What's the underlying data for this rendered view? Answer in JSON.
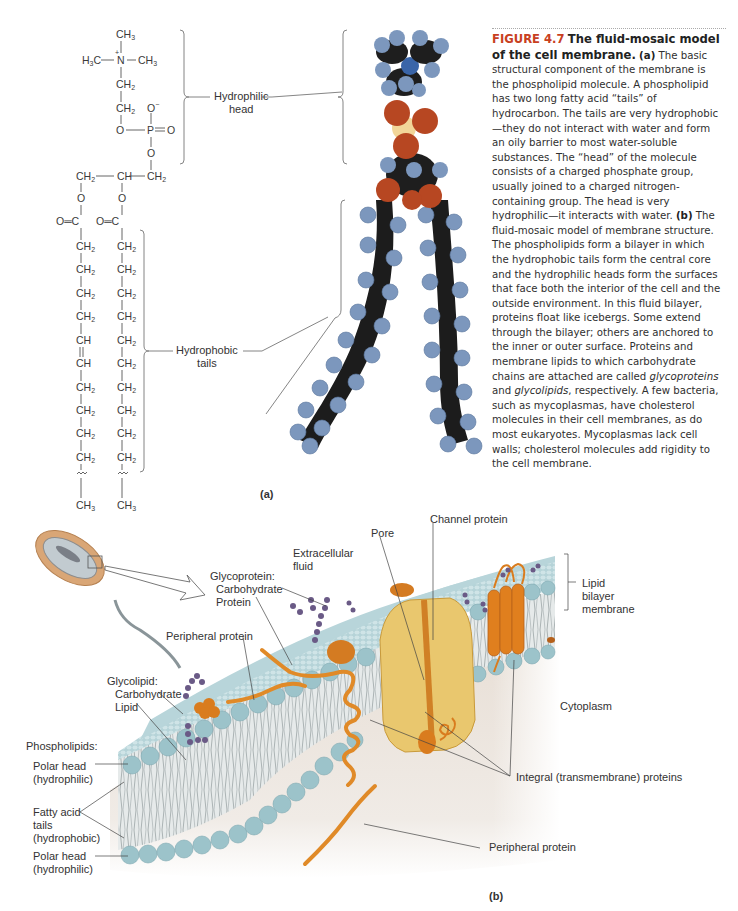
{
  "figure": {
    "number": "FIGURE 4.7",
    "title": "The fluid-mosaic model of the cell membrane.",
    "accent_color": "#c8401f"
  },
  "caption": {
    "part_a_label": "(a)",
    "part_a_text": "The basic structural component of the membrane is the phospholipid molecule. A phospholipid has two long fatty acid “tails” of hydrocarbon. The tails are very hydrophobic—they do not interact with water and form an oily barrier to most water-soluble substances. The “head” of the molecule consists of a charged phosphate group, usually joined to a charged nitrogen-containing group. The head is very hydrophilic—it interacts with water.",
    "part_b_label": "(b)",
    "part_b_text_1": "The fluid-mosaic model of membrane structure. The phospholipids form a bilayer in which the hydrophobic tails form the central core and the hydrophilic heads form the surfaces that face both the interior of the cell and the outside environment. In this fluid bilayer, proteins float like icebergs. Some extend through the bilayer; others are anchored to the inner or outer surface. Proteins and membrane lipids to which carbohydrate chains are attached are called ",
    "term_glycoproteins": "glycoproteins",
    "and": " and ",
    "term_glycolipids": "glycolipids",
    "part_b_text_2": ", respectively. A few bacteria, such as mycoplasmas, have cholesterol molecules in their cell membranes, as do most eukaryotes. Mycoplasmas lack cell walls; cholesterol molecules add rigidity to the cell membrane."
  },
  "panel_a": {
    "label": "(a)",
    "head_label_line1": "Hydrophilic",
    "head_label_line2": "head",
    "tails_label_line1": "Hydrophobic",
    "tails_label_line2": "tails",
    "formula": {
      "ch3_top": "CH3",
      "n_group_left": "H3C",
      "n_atom": "N",
      "n_charge": "+",
      "n_group_right": "CH3",
      "ch2": "CH2",
      "o_minus": "O",
      "o": "O",
      "p": "P",
      "eq_o": "O",
      "glycerol": [
        "CH2",
        "CH",
        "CH2"
      ],
      "carbonyl": "O=C",
      "chain_left": [
        "CH2",
        "CH2",
        "CH2",
        "CH2",
        "CH",
        "CH",
        "CH2",
        "CH2",
        "CH2",
        "CH2"
      ],
      "chain_right": [
        "CH2",
        "CH2",
        "CH2",
        "CH2",
        "CH2",
        "CH2",
        "CH2",
        "CH2",
        "CH2",
        "CH2"
      ],
      "terminal": "CH3"
    }
  },
  "panel_b": {
    "label": "(b)",
    "labels": {
      "extracellular_1": "Extracellular",
      "extracellular_2": "fluid",
      "glycoprotein_1": "Glycoprotein:",
      "glycoprotein_2": "Carbohydrate",
      "glycoprotein_3": "Protein",
      "peripheral_top": "Peripheral protein",
      "glycolipid_1": "Glycolipid:",
      "glycolipid_2": "Carbohydrate",
      "glycolipid_3": "Lipid",
      "pore": "Pore",
      "channel": "Channel protein",
      "lipid_bilayer_1": "Lipid",
      "lipid_bilayer_2": "bilayer",
      "lipid_bilayer_3": "membrane",
      "cytoplasm": "Cytoplasm",
      "phospholipids": "Phospholipids:",
      "polar_head_top_1": "Polar head",
      "polar_head_top_2": "(hydrophilic)",
      "fatty_acid_1": "Fatty acid",
      "fatty_acid_2": "tails",
      "fatty_acid_3": "(hydrophobic)",
      "polar_head_bot_1": "Polar head",
      "polar_head_bot_2": "(hydrophilic)",
      "integral": "Integral (transmembrane) proteins",
      "peripheral_bottom": "Peripheral protein"
    },
    "colors": {
      "membrane_blue": "#a9cdd3",
      "head_blue": "#8fbcc4",
      "protein_orange": "#e07f1e",
      "channel_yellow": "#e7c774",
      "carbohydrate_purple": "#6a5a86",
      "cytoplasm": "#e9e2dc",
      "bacterium": "#d9a676"
    }
  }
}
